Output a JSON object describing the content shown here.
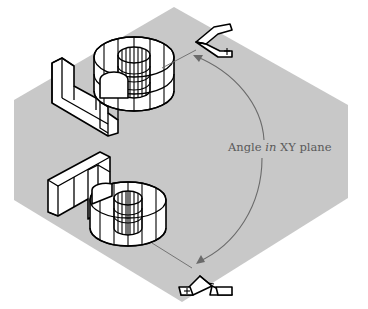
{
  "figure": {
    "background_color": "#ffffff",
    "plane_color": "#c8c8c8",
    "line_color": "#000000",
    "annotation_color": "#6a6a6a"
  },
  "annotation": {
    "text_before": "Angle ",
    "text_italic": "in",
    "text_after": " XY plane"
  },
  "objects": [
    {
      "name": "upper-part",
      "type": "wireframe-solid",
      "parts": [
        "rectangular-bracket",
        "hollow-cylinder"
      ]
    },
    {
      "name": "lower-part",
      "type": "wireframe-solid",
      "parts": [
        "rectangular-bracket",
        "hollow-cylinder"
      ]
    }
  ],
  "icons": [
    {
      "name": "ucs-icon-top",
      "glyph": "ucs-axis-icon"
    },
    {
      "name": "ucs-icon-bottom",
      "glyph": "ucs-axis-icon"
    }
  ]
}
